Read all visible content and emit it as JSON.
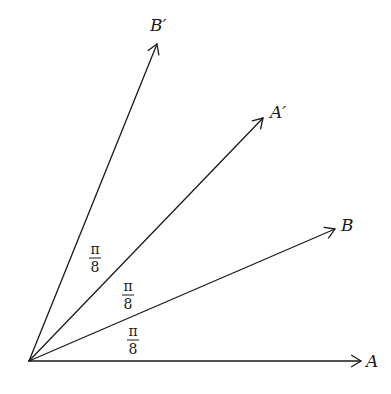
{
  "diagram": {
    "origin": [
      29,
      361
    ],
    "vectors": [
      {
        "id": "A",
        "label": "A",
        "tip": [
          361,
          361
        ],
        "label_pos": [
          366,
          367
        ]
      },
      {
        "id": "B",
        "label": "B",
        "tip": [
          335,
          229
        ],
        "label_pos": [
          341,
          231
        ]
      },
      {
        "id": "A_prime",
        "label": "A′",
        "tip": [
          263,
          118
        ],
        "label_pos": [
          270,
          118
        ]
      },
      {
        "id": "B_prime",
        "label": "B′",
        "tip": [
          157,
          44
        ],
        "label_pos": [
          150,
          31
        ]
      }
    ],
    "angle_labels": [
      {
        "id": "angle-A-B",
        "numerator": "π",
        "denominator": "8",
        "center": [
          133,
          340
        ]
      },
      {
        "id": "angle-B-Aprime",
        "numerator": "π",
        "denominator": "8",
        "center": [
          128,
          295
        ]
      },
      {
        "id": "angle-Aprime-Bprime",
        "numerator": "π",
        "denominator": "8",
        "center": [
          95,
          258
        ]
      }
    ],
    "stroke_color": "#1a1a1a",
    "background": "#ffffff"
  }
}
